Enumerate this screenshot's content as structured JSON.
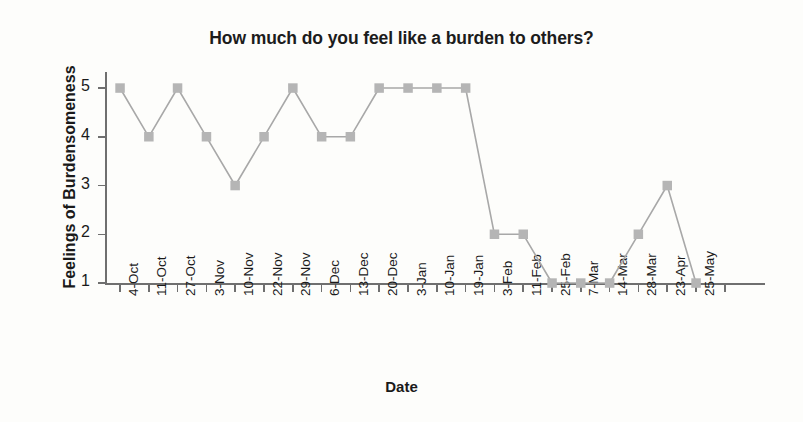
{
  "chart_data": {
    "type": "line",
    "title": "How much do you feel like a burden to others?",
    "xlabel": "Date",
    "ylabel": "Feelings of Burdensomeness",
    "categories": [
      "4-Oct",
      "11-Oct",
      "27-Oct",
      "3-Nov",
      "10-Nov",
      "22-Nov",
      "29-Nov",
      "6-Dec",
      "13-Dec",
      "20-Dec",
      "3-Jan",
      "10-Jan",
      "19-Jan",
      "3-Feb",
      "11-Feb",
      "25-Feb",
      "7-Mar",
      "14-Mar",
      "28-Mar",
      "23-Apr",
      "25-May"
    ],
    "values": [
      5,
      4,
      5,
      4,
      3,
      4,
      5,
      4,
      4,
      5,
      5,
      5,
      5,
      2,
      2,
      1,
      1,
      1,
      2,
      3,
      1
    ],
    "ylim": [
      1,
      5
    ],
    "yticks": [
      1,
      2,
      3,
      4,
      5
    ],
    "ytick_labels": [
      "1",
      "2",
      "3",
      "4",
      "5"
    ],
    "grid": false,
    "legend": false,
    "marker": "square",
    "marker_color": "#b5b5b5",
    "line_color": "#a8a8a8"
  }
}
